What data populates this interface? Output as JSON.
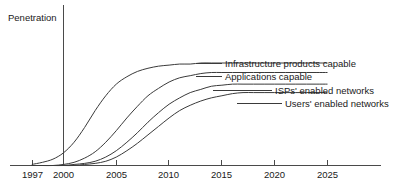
{
  "chart_data": {
    "type": "line",
    "title": "",
    "subtitle": "",
    "xlabel": "",
    "ylabel": "Penetration",
    "grid": false,
    "legend_position": "inline-right-end-labels",
    "xlim": [
      1996,
      2026
    ],
    "ylim": [
      0,
      100
    ],
    "x_ticks": [
      "1997",
      "2000",
      "2005",
      "2010",
      "2015",
      "2020",
      "2025"
    ],
    "y_ticks": [],
    "x": [
      1997,
      1998,
      1999,
      2000,
      2001,
      2002,
      2003,
      2004,
      2005,
      2006,
      2007,
      2008,
      2009,
      2010,
      2011,
      2012,
      2013,
      2014,
      2015,
      2016,
      2017,
      2018,
      2019,
      2020,
      2021,
      2022,
      2023,
      2024,
      2025
    ],
    "series": [
      {
        "name": "Infrastructure products capable",
        "label": "Infrastructure products capable",
        "color": "#3a3a3a",
        "values": [
          1,
          3,
          6,
          12,
          22,
          36,
          52,
          66,
          77,
          84,
          89,
          92,
          94,
          95,
          96,
          96,
          97,
          97,
          97,
          97,
          97,
          97,
          97,
          97,
          97,
          97,
          97,
          97,
          97
        ]
      },
      {
        "name": "Applications capable",
        "label": "Applications capable",
        "color": "#3a3a3a",
        "values": [
          0,
          0,
          0,
          1,
          3,
          7,
          13,
          22,
          33,
          45,
          56,
          66,
          73,
          79,
          83,
          85,
          87,
          88,
          88,
          88,
          88,
          88,
          88,
          88,
          88,
          88,
          88,
          88,
          88
        ]
      },
      {
        "name": "ISPs' enabled networks",
        "label": "ISPs' enabled networks",
        "color": "#3a3a3a",
        "values": [
          0,
          0,
          0,
          0,
          1,
          2,
          4,
          8,
          14,
          22,
          31,
          41,
          50,
          58,
          64,
          69,
          72,
          75,
          76,
          77,
          77,
          77,
          77,
          77,
          77,
          77,
          77,
          77,
          77
        ]
      },
      {
        "name": "Users' enabled networks",
        "label": "Users' enabled networks",
        "color": "#3a3a3a",
        "values": [
          0,
          0,
          0,
          0,
          0,
          1,
          2,
          4,
          8,
          14,
          21,
          29,
          37,
          45,
          52,
          57,
          61,
          64,
          66,
          68,
          69,
          69,
          69,
          69,
          69,
          69,
          69,
          69,
          69
        ]
      }
    ],
    "annotations": []
  },
  "axes": {
    "y_axis_title": "Penetration",
    "x_tick_labels": [
      {
        "text": "1997",
        "x": 1997
      },
      {
        "text": "2000",
        "x": 2000
      },
      {
        "text": "2005",
        "x": 2005
      },
      {
        "text": "2010",
        "x": 2010
      },
      {
        "text": "2015",
        "x": 2015
      },
      {
        "text": "2020",
        "x": 2020
      },
      {
        "text": "2025",
        "x": 2025
      }
    ]
  },
  "labels": {
    "series_1": "Infrastructure products capable",
    "series_2": "Applications capable",
    "series_3": "ISPs' enabled networks",
    "series_4": "Users' enabled networks"
  },
  "colors": {
    "curve": "#3a3a3a",
    "axis": "#4a4a4a",
    "text": "#1a1a1a",
    "background": "#ffffff"
  }
}
